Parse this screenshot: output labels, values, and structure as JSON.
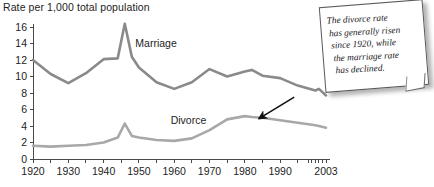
{
  "chart_data": {
    "type": "line",
    "title": "Rate per 1,000 total population",
    "xlabel": "",
    "ylabel": "",
    "xlim": [
      1920,
      2003
    ],
    "ylim": [
      0,
      16
    ],
    "yticks": [
      0,
      2,
      4,
      6,
      8,
      10,
      12,
      14,
      16
    ],
    "xticks": [
      1920,
      1925,
      1930,
      1935,
      1940,
      1945,
      1950,
      1955,
      1960,
      1965,
      1970,
      1975,
      1980,
      1985,
      1990,
      1995,
      1998,
      1999,
      2000,
      2001,
      2002,
      2003
    ],
    "xtick_labels": [
      "1920",
      "1930",
      "1940",
      "1950",
      "1960",
      "1970",
      "1980",
      "1990",
      "2003"
    ],
    "xtick_label_values": [
      1920,
      1930,
      1940,
      1950,
      1960,
      1970,
      1980,
      1990,
      2003
    ],
    "grid": false,
    "legend_position": "inline-labels",
    "x": [
      1920,
      1925,
      1930,
      1935,
      1940,
      1944,
      1946,
      1948,
      1950,
      1955,
      1960,
      1965,
      1970,
      1975,
      1980,
      1982,
      1985,
      1990,
      1995,
      2000,
      2001,
      2003
    ],
    "series": [
      {
        "name": "Marriage",
        "color": "#8a8a8a",
        "label_x": 1949,
        "label_y": 13.6,
        "values": [
          12.0,
          10.3,
          9.2,
          10.4,
          12.1,
          12.2,
          16.4,
          12.4,
          11.1,
          9.3,
          8.5,
          9.3,
          10.9,
          10.0,
          10.6,
          10.8,
          10.1,
          9.8,
          8.9,
          8.3,
          8.5,
          7.7
        ]
      },
      {
        "name": "Divorce",
        "color": "#a8a8a8",
        "label_x": 1959,
        "label_y": 4.3,
        "values": [
          1.6,
          1.5,
          1.6,
          1.7,
          2.0,
          2.6,
          4.3,
          2.8,
          2.6,
          2.3,
          2.2,
          2.5,
          3.5,
          4.8,
          5.2,
          5.1,
          5.0,
          4.7,
          4.4,
          4.1,
          4.0,
          3.8
        ]
      }
    ],
    "annotation": {
      "text": "The divorce rate has generally risen since 1920, while the marriage rate has declined.",
      "lines": [
        "The divorce rate",
        "has generally risen",
        "since 1920, while",
        "the marriage rate",
        "has declined."
      ],
      "arrow_from": [
        1994,
        7.5
      ],
      "arrow_to": [
        1984,
        4.9
      ]
    }
  }
}
